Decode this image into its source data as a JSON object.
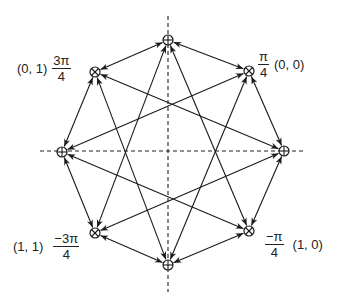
{
  "diagram": {
    "type": "constellation",
    "axis_color": "#222222",
    "line_color": "#1a1a1a",
    "nodes": [
      {
        "id": "n90",
        "angle_deg": 90,
        "marker": "circle-plus",
        "x": 168,
        "y": 40
      },
      {
        "id": "n45",
        "angle_deg": 45,
        "marker": "circle-times",
        "x": 249,
        "y": 71
      },
      {
        "id": "n0",
        "angle_deg": 0,
        "marker": "circle-plus",
        "x": 284,
        "y": 151
      },
      {
        "id": "nm45",
        "angle_deg": -45,
        "marker": "circle-times",
        "x": 249,
        "y": 231
      },
      {
        "id": "nm90",
        "angle_deg": -90,
        "marker": "circle-plus",
        "x": 168,
        "y": 265
      },
      {
        "id": "nm135",
        "angle_deg": -135,
        "marker": "circle-times",
        "x": 95,
        "y": 233
      },
      {
        "id": "n180",
        "angle_deg": 180,
        "marker": "circle-plus",
        "x": 62,
        "y": 152
      },
      {
        "id": "n135",
        "angle_deg": 135,
        "marker": "circle-times",
        "x": 95,
        "y": 72
      }
    ],
    "edges": [
      [
        "n90",
        "n45"
      ],
      [
        "n45",
        "n0"
      ],
      [
        "n0",
        "nm45"
      ],
      [
        "nm45",
        "nm90"
      ],
      [
        "nm90",
        "nm135"
      ],
      [
        "nm135",
        "n180"
      ],
      [
        "n180",
        "n135"
      ],
      [
        "n135",
        "n90"
      ],
      [
        "n90",
        "nm135"
      ],
      [
        "n90",
        "nm45"
      ],
      [
        "n180",
        "n45"
      ],
      [
        "n180",
        "nm45"
      ],
      [
        "n0",
        "n135"
      ],
      [
        "n0",
        "nm135"
      ],
      [
        "nm90",
        "n135"
      ],
      [
        "nm90",
        "n45"
      ]
    ],
    "axes": {
      "horizontal": {
        "x1": 40,
        "x2": 306,
        "y": 151
      },
      "vertical": {
        "x": 168,
        "y1": 16,
        "y2": 292
      }
    },
    "labels": {
      "upper_left": {
        "bits": "(0, 1)",
        "num": "3π",
        "den": "4"
      },
      "upper_right": {
        "bits": "(0, 0)",
        "num": "π",
        "den": "4"
      },
      "lower_left": {
        "bits": "(1, 1)",
        "num": "−3π",
        "den": "4"
      },
      "lower_right": {
        "bits": "(1, 0)",
        "num": "−π",
        "den": "4"
      }
    }
  }
}
